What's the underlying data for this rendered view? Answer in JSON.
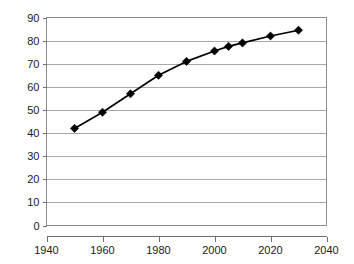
{
  "chart_data": {
    "type": "line",
    "title": "",
    "subtitle": "",
    "xlabel": "",
    "ylabel": "",
    "x": [
      1950,
      1960,
      1970,
      1980,
      1990,
      2000,
      2005,
      2010,
      2020,
      2030
    ],
    "values": [
      42,
      49,
      57,
      65,
      71,
      75.5,
      77.5,
      79,
      82,
      84.5
    ],
    "series": [
      {
        "name": "",
        "x": [
          1950,
          1960,
          1970,
          1980,
          1990,
          2000,
          2005,
          2010,
          2020,
          2030
        ],
        "values": [
          42,
          49,
          57,
          65,
          71,
          75.5,
          77.5,
          79,
          82,
          84.5
        ]
      }
    ],
    "xlim": [
      1940,
      2040
    ],
    "ylim": [
      0,
      90
    ],
    "x_ticks": [
      1940,
      1960,
      1980,
      2000,
      2020,
      2040
    ],
    "x_tick_labels": [
      "1940",
      "1960",
      "1980",
      "2000",
      "2020",
      "2040"
    ],
    "y_ticks": [
      0,
      10,
      20,
      30,
      40,
      50,
      60,
      70,
      80,
      90
    ],
    "y_tick_labels": [
      "0",
      "10",
      "20",
      "30",
      "40",
      "50",
      "60",
      "70",
      "80",
      "90"
    ],
    "grid": "horizontal",
    "legend": "none",
    "marker": "diamond",
    "annotations": [],
    "colors": {
      "line": "#000000",
      "marker": "#000000",
      "gridline": "#a8a8a8",
      "border": "#8c8c8c",
      "axis": "#6e6e6e",
      "background": "#ffffff",
      "tick_text": "#1a1a1a"
    }
  }
}
